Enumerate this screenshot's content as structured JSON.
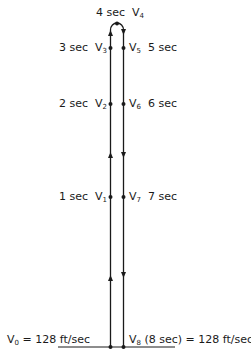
{
  "diagram": {
    "top": {
      "time": "4 sec",
      "velocity": "V",
      "sub": "4"
    },
    "ascending": [
      {
        "time": "3 sec",
        "velocity": "V",
        "sub": "3"
      },
      {
        "time": "2 sec",
        "velocity": "V",
        "sub": "2"
      },
      {
        "time": "1 sec",
        "velocity": "V",
        "sub": "1"
      }
    ],
    "descending": [
      {
        "time": "5 sec",
        "velocity": "V",
        "sub": "5"
      },
      {
        "time": "6 sec",
        "velocity": "V",
        "sub": "6"
      },
      {
        "time": "7 sec",
        "velocity": "V",
        "sub": "7"
      }
    ],
    "bottom_left": {
      "velocity": "V",
      "sub": "0",
      "rest": "= 128 ft/sec"
    },
    "bottom_right": {
      "velocity": "V",
      "sub": "8",
      "rest": "(8 sec) = 128 ft/sec"
    },
    "line_color": "#1a1a1a"
  }
}
